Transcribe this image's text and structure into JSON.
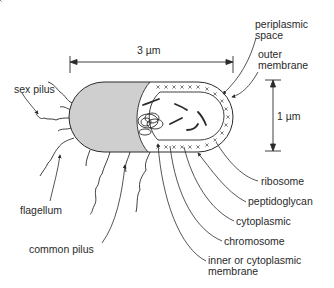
{
  "figure": {
    "colors": {
      "line": "#2a2a2a",
      "cap_fill": "#cfcfcf",
      "background": "#ffffff"
    }
  },
  "dimensions": {
    "length": "3 µm",
    "width": "1 µm"
  },
  "labels": {
    "periplasmic_space": [
      "periplasmic",
      "space"
    ],
    "outer_membrane": [
      "outer",
      "membrane"
    ],
    "sex_pilus": "sex pilus",
    "flagellum": "flagellum",
    "common_pilus": "common pilus",
    "ribosome": "ribosome",
    "peptidoglycan": "peptidoglycan",
    "cytoplasmic": "cytoplasmic",
    "chromosome": "chromosome",
    "inner_membrane": [
      "inner or cytoplasmic",
      "membrane"
    ]
  }
}
